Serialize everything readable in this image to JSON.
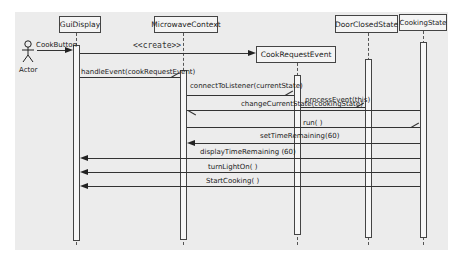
{
  "diagram": {
    "type": "UML sequence diagram",
    "actor": {
      "label": "Actor"
    },
    "participants": [
      {
        "id": "gui",
        "label": "GuiDisplay"
      },
      {
        "id": "mc",
        "label": "MicrowaveContext"
      },
      {
        "id": "cre",
        "label": "CookRequestEvent"
      },
      {
        "id": "dcs",
        "label": "DoorClosedState"
      },
      {
        "id": "cs",
        "label": "CookingState"
      }
    ],
    "messages": [
      {
        "from": "actor",
        "to": "gui",
        "label": "CookButton"
      },
      {
        "from": "gui",
        "to": "cre",
        "label": "<<create>>"
      },
      {
        "from": "gui",
        "to": "mc",
        "label": "handleEvent(cookRequestEvent)"
      },
      {
        "from": "mc",
        "to": "cre",
        "label": "connectToListener(currentState)"
      },
      {
        "from": "cre",
        "to": "dcs",
        "label": "processEvent(this)"
      },
      {
        "from": "dcs",
        "to": "mc",
        "label": "changeCurrentState(cookingState)"
      },
      {
        "from": "mc",
        "to": "cs",
        "label": "run( )"
      },
      {
        "from": "cs",
        "to": "mc",
        "label": "setTimeRemaining(60)"
      },
      {
        "from": "cs",
        "to": "gui",
        "label": "displayTimeRemaining (60)"
      },
      {
        "from": "cs",
        "to": "gui",
        "label": "turnLightOn( )"
      },
      {
        "from": "cs",
        "to": "gui",
        "label": "StartCooking( )"
      }
    ]
  }
}
